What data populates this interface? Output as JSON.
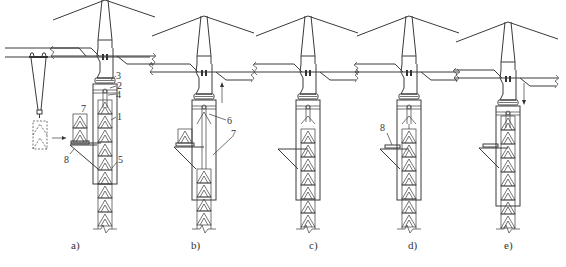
{
  "figure": {
    "type": "technical-diagram",
    "colors": {
      "line": "#3a3a3a",
      "background": "#ffffff"
    },
    "panels": [
      {
        "id": "a",
        "caption": "a)",
        "callouts": [
          "1",
          "2",
          "3",
          "4",
          "5",
          "7",
          "8"
        ],
        "motion": "section hoisted toward frame"
      },
      {
        "id": "b",
        "caption": "b)",
        "callouts": [
          "6",
          "7"
        ],
        "motion": "up"
      },
      {
        "id": "c",
        "caption": "c)",
        "callouts": []
      },
      {
        "id": "d",
        "caption": "d)",
        "callouts": [
          "8"
        ]
      },
      {
        "id": "e",
        "caption": "e)",
        "callouts": [],
        "motion": "down"
      }
    ],
    "labels": {
      "n1": "1",
      "n2": "2",
      "n3": "3",
      "n4": "4",
      "n5": "5",
      "n6": "6",
      "n7a": "7",
      "n7b": "7",
      "n8a": "8",
      "n8d": "8"
    }
  }
}
